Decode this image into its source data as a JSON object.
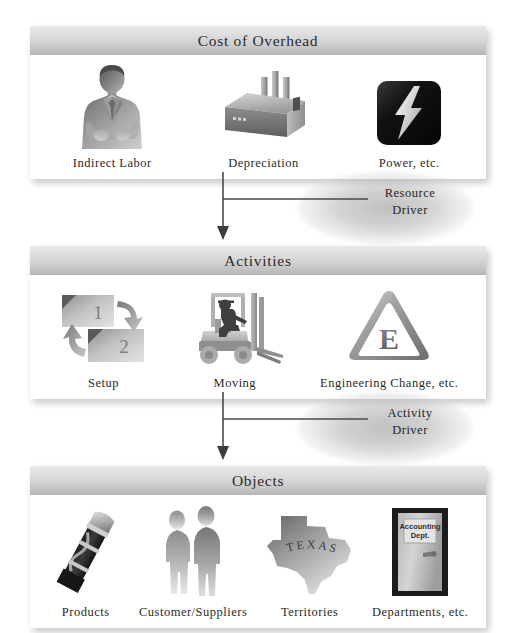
{
  "diagram": {
    "colors": {
      "header_gradient_top": "#e9e9e9",
      "header_gradient_bottom": "#b4b4b4",
      "panel_background": "#ffffff",
      "page_background": "#ffffff",
      "text": "#2a2a2a",
      "arrow": "#4a4a4a"
    }
  },
  "panels": [
    {
      "header": "Cost of Overhead",
      "items": [
        {
          "label": "Indirect Labor",
          "icon": "businessman-icon"
        },
        {
          "label": "Depreciation",
          "icon": "factory-icon"
        },
        {
          "label": "Power, etc.",
          "icon": "lightning-bolt-icon"
        }
      ]
    },
    {
      "header": "Activities",
      "items": [
        {
          "label": "Setup",
          "icon": "setup-cycle-icon",
          "box_one": "1",
          "box_two": "2"
        },
        {
          "label": "Moving",
          "icon": "forklift-icon"
        },
        {
          "label": "Engineering Change, etc.",
          "icon": "warning-triangle-e-icon",
          "triangle_letter": "E"
        }
      ]
    },
    {
      "header": "Objects",
      "items": [
        {
          "label": "Products",
          "icon": "flashlight-icon"
        },
        {
          "label": "Customer/Suppliers",
          "icon": "two-people-icon"
        },
        {
          "label": "Territories",
          "icon": "texas-map-icon",
          "map_text": "TEXAS"
        },
        {
          "label": "Departments, etc.",
          "icon": "door-icon",
          "door_sign_line1": "Accounting",
          "door_sign_line2": "Dept."
        }
      ]
    }
  ],
  "connectors": [
    {
      "label_line1": "Resource",
      "label_line2": "Driver",
      "icon": "down-arrow-icon"
    },
    {
      "label_line1": "Activity",
      "label_line2": "Driver",
      "icon": "down-arrow-icon"
    }
  ]
}
